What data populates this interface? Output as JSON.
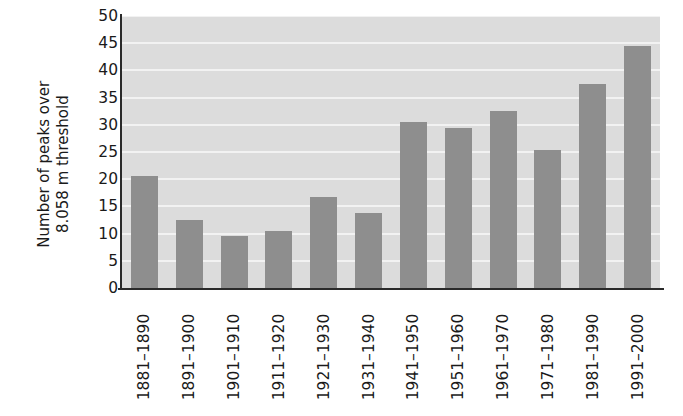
{
  "chart_data": {
    "type": "bar",
    "title": "",
    "subtitle": "",
    "xlabel": "",
    "ylabel": "Number of peaks over\n8.058 m threshold",
    "categories": [
      "1881–1890",
      "1891–1900",
      "1901–1910",
      "1911–1920",
      "1921–1930",
      "1931–1940",
      "1941–1950",
      "1951–1960",
      "1961–1970",
      "1971–1980",
      "1981–1990",
      "1991–2000"
    ],
    "values": [
      20.5,
      12.5,
      9.5,
      10.5,
      16.7,
      13.8,
      30.5,
      29.5,
      32.5,
      25.3,
      37.5,
      44.5
    ],
    "ylim": [
      0,
      50
    ],
    "ytick_step": 5,
    "yticks": [
      0,
      5,
      10,
      15,
      20,
      25,
      30,
      35,
      40,
      45,
      50
    ],
    "ytick_labels": [
      "0",
      "5",
      "10",
      "15",
      "20",
      "25",
      "30",
      "35",
      "40",
      "45",
      "50"
    ],
    "grid": true,
    "grid_axis": "y",
    "legend": false,
    "legend_position": "none",
    "bar_color": "#8e8e8e",
    "plot_background": "#dcdcdc",
    "gridline_color": "#f2f2f2",
    "axis_color": "#2a2a2a",
    "text_color": "#1a1a1a",
    "xtick_rotation": -90
  }
}
